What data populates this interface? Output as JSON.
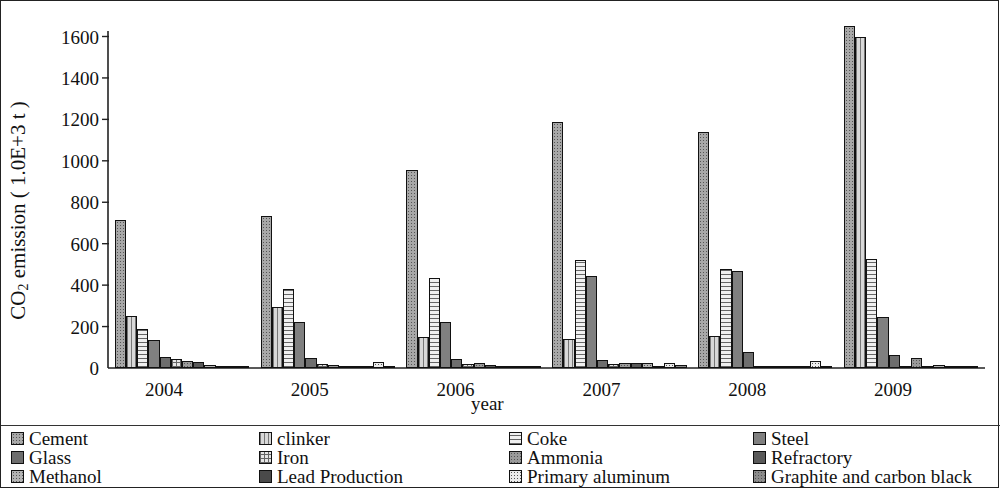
{
  "figure": {
    "ylabel_main": "CO",
    "ylabel_sub": "2",
    "ylabel_rest": " emission ( 1.0E+3 t )",
    "xlabel": "year"
  },
  "chart_data": {
    "type": "bar",
    "title": "",
    "xlabel": "year",
    "ylabel": "CO2 emission ( 1.0E+3 t )",
    "ylim": [
      0,
      1700
    ],
    "yticks": [
      0,
      200,
      400,
      600,
      800,
      1000,
      1200,
      1400,
      1600
    ],
    "ytick_labels": [
      "0",
      "200",
      "400",
      "600",
      "800",
      "1000",
      "1200",
      "1400",
      "1600"
    ],
    "categories": [
      "2004",
      "2005",
      "2006",
      "2007",
      "2008",
      "2009"
    ],
    "grid": false,
    "legend_position": "bottom",
    "series": [
      {
        "name": "Cement",
        "color": "#a8a8a8",
        "pattern": "dots",
        "values": [
          715,
          735,
          955,
          1185,
          1140,
          1650
        ]
      },
      {
        "name": "clinker",
        "color": "#d8d8d8",
        "pattern": "vlines",
        "values": [
          250,
          295,
          150,
          140,
          155,
          1600
        ]
      },
      {
        "name": "Coke",
        "color": "#f0f0f0",
        "pattern": "hlines",
        "values": [
          190,
          380,
          435,
          520,
          480,
          525
        ]
      },
      {
        "name": "Steel",
        "color": "#808080",
        "pattern": "solid",
        "values": [
          135,
          220,
          220,
          445,
          470,
          245
        ]
      },
      {
        "name": "Glass",
        "color": "#6e6e6e",
        "pattern": "solid",
        "values": [
          55,
          50,
          45,
          40,
          75,
          65
        ]
      },
      {
        "name": "Iron",
        "color": "#e6e6e6",
        "pattern": "grid",
        "values": [
          45,
          18,
          20,
          20,
          12,
          12
        ]
      },
      {
        "name": "Ammonia",
        "color": "#9a9a9a",
        "pattern": "dots",
        "values": [
          35,
          14,
          22,
          25,
          10,
          48
        ]
      },
      {
        "name": "Refractory",
        "color": "#5a5a5a",
        "pattern": "solid",
        "values": [
          28,
          12,
          14,
          22,
          8,
          10
        ]
      },
      {
        "name": "Methanol",
        "color": "#b4b4b4",
        "pattern": "dots",
        "values": [
          14,
          10,
          10,
          26,
          6,
          16
        ]
      },
      {
        "name": "Lead Production",
        "color": "#4a4a4a",
        "pattern": "solid",
        "values": [
          8,
          8,
          8,
          10,
          5,
          8
        ]
      },
      {
        "name": "Primary aluminum",
        "color": "#ececec",
        "pattern": "dots",
        "values": [
          5,
          30,
          12,
          26,
          36,
          5
        ]
      },
      {
        "name": "Graphite and carbon black",
        "color": "#8c8c8c",
        "pattern": "dots",
        "values": [
          4,
          6,
          8,
          14,
          12,
          6
        ]
      }
    ]
  },
  "legend": {
    "items": [
      {
        "label": "Cement"
      },
      {
        "label": "clinker"
      },
      {
        "label": "Coke"
      },
      {
        "label": "Steel"
      },
      {
        "label": "Glass"
      },
      {
        "label": "Iron"
      },
      {
        "label": "Ammonia"
      },
      {
        "label": "Refractory"
      },
      {
        "label": "Methanol"
      },
      {
        "label": "Lead Production"
      },
      {
        "label": "Primary aluminum"
      },
      {
        "label": "Graphite and carbon black"
      }
    ]
  }
}
